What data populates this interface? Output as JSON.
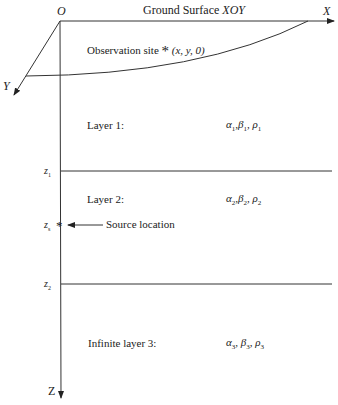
{
  "title": "Ground Surface XOY",
  "title_prefix": "Ground Surface",
  "title_plane": "XOY",
  "axes": {
    "origin": "O",
    "x": "X",
    "y": "Y",
    "z": "Z"
  },
  "observation": {
    "label": "Observation site",
    "marker": "*",
    "coords": "(x, y, 0)"
  },
  "depth_marks": {
    "z1": {
      "base": "z",
      "sub": "1"
    },
    "zs": {
      "base": "z",
      "sub": "s"
    },
    "z2": {
      "base": "z",
      "sub": "2"
    }
  },
  "source": {
    "marker": "*",
    "label": "Source location"
  },
  "layers": [
    {
      "name": "Layer 1:",
      "alpha": "α",
      "beta": "β",
      "rho": "ρ",
      "index": "1"
    },
    {
      "name": "Layer 2:",
      "alpha": "α",
      "beta": "β",
      "rho": "ρ",
      "index": "2"
    },
    {
      "name": "Infinite layer 3:",
      "alpha": "α",
      "beta": "β",
      "rho": "ρ",
      "index": "3"
    }
  ],
  "colors": {
    "line": "#333333",
    "text": "#222222",
    "background": "#ffffff"
  }
}
